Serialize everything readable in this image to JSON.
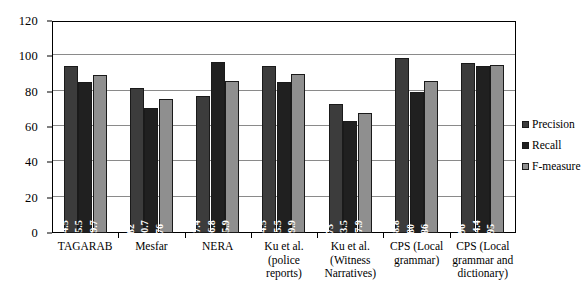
{
  "chart_data": {
    "type": "bar",
    "title": "",
    "xlabel": "",
    "ylabel": "",
    "ylim": [
      0,
      120
    ],
    "yticks": [
      0,
      20,
      40,
      60,
      80,
      100,
      120
    ],
    "grid": true,
    "legend_position": "right",
    "categories": [
      "TAGARAB",
      "Mesfar",
      "NERA",
      "Ku et al. (police reports)",
      "Ku et al. (Witness Narratives)",
      "CPS (Local grammar)",
      "CPS (Local grammar and dictionary)"
    ],
    "series": [
      {
        "name": "Precision",
        "color": "#3c3c3c",
        "values": [
          94.5,
          82,
          77.4,
          94.5,
          73,
          98.8,
          96
        ],
        "labels": [
          "94.5",
          "82",
          "77.4",
          "94.5",
          "73",
          "98.8",
          "96"
        ]
      },
      {
        "name": "Recall",
        "color": "#202020",
        "values": [
          85.5,
          70.7,
          96.8,
          85.5,
          63.5,
          80,
          94.4
        ],
        "labels": [
          "85.5",
          "70.7",
          "96.8",
          "85.5",
          "63.5",
          "80",
          "94.4"
        ]
      },
      {
        "name": "F-measure",
        "color": "#8f8f8f",
        "values": [
          89.7,
          76,
          85.9,
          89.9,
          67.9,
          86,
          95
        ],
        "labels": [
          "89.7",
          "76",
          "85.9",
          "89.9",
          "67.9",
          "86",
          "95"
        ]
      }
    ]
  },
  "axis": {
    "y_tick_labels": [
      "0",
      "20",
      "40",
      "60",
      "80",
      "100",
      "120"
    ]
  },
  "legend": {
    "items": [
      {
        "label": "Precision",
        "key": "precision"
      },
      {
        "label": "Recall",
        "key": "recall"
      },
      {
        "label": "F-measure",
        "key": "fmeasure"
      }
    ]
  }
}
